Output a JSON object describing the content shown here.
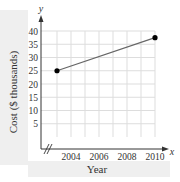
{
  "chart_data": {
    "type": "line",
    "title": "",
    "xlabel": "Year",
    "ylabel": "Cost ($ thousands)",
    "x_axis_letter": "x",
    "y_axis_letter": "y",
    "xlim": [
      2002,
      2011
    ],
    "ylim": [
      0,
      42
    ],
    "x_ticks": [
      2004,
      2006,
      2008,
      2010
    ],
    "x_tick_labels": [
      "2004",
      "2006",
      "2008",
      "2010"
    ],
    "y_ticks": [
      5,
      10,
      15,
      20,
      25,
      30,
      35,
      40
    ],
    "y_tick_labels": [
      "5",
      "10",
      "15",
      "20",
      "25",
      "30",
      "35",
      "40"
    ],
    "x_grid_step": 1,
    "y_grid_step": 5,
    "grid": true,
    "axis_break": true,
    "series": [
      {
        "name": "Cost",
        "points": [
          {
            "x": 2003,
            "y": 25
          },
          {
            "x": 2010,
            "y": 37.5
          }
        ]
      }
    ],
    "colors": {
      "line": "#666666",
      "point": "#000000",
      "grid": "#dddddd",
      "axis": "#333333",
      "label_band": "#efefef"
    }
  }
}
